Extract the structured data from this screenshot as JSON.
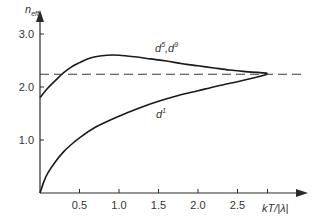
{
  "chart_data": {
    "type": "line",
    "title": "",
    "xlabel": "kT/|λ|",
    "ylabel": "n_eff",
    "xlim": [
      0,
      3.0
    ],
    "ylim": [
      0,
      3.3
    ],
    "grid": false,
    "x_ticks": [
      0.5,
      1.0,
      1.5,
      2.0,
      2.5
    ],
    "x_tick_labels": [
      "0.5",
      "1.0",
      "1.5",
      "2.0",
      "2.5"
    ],
    "y_ticks": [
      1.0,
      2.0,
      3.0
    ],
    "y_tick_labels": [
      "1.0",
      "2.0",
      "3.0"
    ],
    "series": [
      {
        "name": "d5,d9",
        "label": "d⁵,d⁹",
        "style": "solid",
        "x": [
          0.0,
          0.1,
          0.2,
          0.3,
          0.4,
          0.5,
          0.6,
          0.7,
          0.85,
          1.0,
          1.2,
          1.4,
          1.6,
          1.8,
          2.0,
          2.2,
          2.4,
          2.6,
          2.88
        ],
        "y": [
          1.8,
          1.98,
          2.13,
          2.27,
          2.38,
          2.46,
          2.53,
          2.57,
          2.6,
          2.6,
          2.57,
          2.53,
          2.49,
          2.44,
          2.4,
          2.36,
          2.32,
          2.29,
          2.26
        ]
      },
      {
        "name": "d1",
        "label": "d¹",
        "style": "solid",
        "x": [
          0.0,
          0.05,
          0.1,
          0.2,
          0.3,
          0.4,
          0.5,
          0.7,
          1.0,
          1.25,
          1.5,
          1.75,
          2.0,
          2.25,
          2.5,
          2.7,
          2.88
        ],
        "y": [
          0.0,
          0.22,
          0.38,
          0.6,
          0.78,
          0.92,
          1.04,
          1.24,
          1.45,
          1.6,
          1.73,
          1.84,
          1.93,
          2.02,
          2.1,
          2.17,
          2.24
        ]
      },
      {
        "name": "limit",
        "label": "",
        "style": "dashed",
        "x": [
          0.0,
          3.35
        ],
        "y": [
          2.24,
          2.24
        ]
      }
    ],
    "annotations": [
      {
        "text": "d⁵,d⁹",
        "x": 1.45,
        "y": 2.72
      },
      {
        "text": "d¹",
        "x": 1.48,
        "y": 1.35
      }
    ]
  },
  "labels": {
    "y_axis_main": "n",
    "y_axis_sub": "eff",
    "x_axis": "kT/|λ|",
    "d59_base1": "d",
    "d59_sup1": "5",
    "d59_sep": ",d",
    "d59_sup2": "9",
    "d1_base": "d",
    "d1_sup": "1"
  }
}
